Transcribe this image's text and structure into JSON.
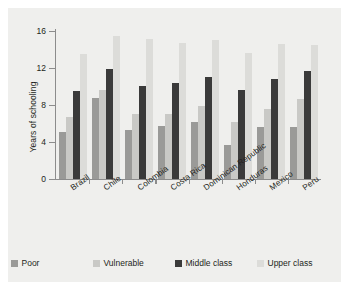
{
  "chart_data": {
    "type": "bar",
    "title": "",
    "subtitle": "",
    "xlabel": "",
    "ylabel": "Years of schooling",
    "ylim": [
      0,
      16
    ],
    "yticks": [
      0,
      4,
      8,
      12,
      16
    ],
    "ytick_labels": [
      "0",
      "4",
      "8",
      "12",
      "16"
    ],
    "grid": false,
    "legend_position": "bottom",
    "categories": [
      "Brazil",
      "Chile",
      "Colombia",
      "Costa Rica",
      "Dominican Republic",
      "Honduras",
      "Mexico",
      "Peru"
    ],
    "series": [
      {
        "name": "Poor",
        "color": "#9a9a98",
        "values": [
          5.1,
          8.8,
          5.3,
          5.7,
          6.2,
          3.7,
          5.6,
          5.6
        ]
      },
      {
        "name": "Vulnerable",
        "color": "#c9c9c6",
        "values": [
          6.7,
          9.6,
          7.0,
          7.0,
          7.9,
          6.2,
          7.6,
          8.7
        ]
      },
      {
        "name": "Middle class",
        "color": "#3a3a3a",
        "values": [
          9.5,
          11.9,
          10.1,
          10.4,
          11.0,
          9.6,
          10.8,
          11.7
        ]
      },
      {
        "name": "Upper class",
        "color": "#dcdcd9",
        "values": [
          13.5,
          15.5,
          15.1,
          14.7,
          15.0,
          13.6,
          14.6,
          14.5
        ]
      }
    ]
  },
  "legend": {
    "items": [
      {
        "label": "Poor",
        "color": "#9a9a98"
      },
      {
        "label": "Vulnerable",
        "color": "#c9c9c6"
      },
      {
        "label": "Middle class",
        "color": "#3a3a3a"
      },
      {
        "label": "Upper class",
        "color": "#dcdcd9"
      }
    ]
  },
  "axis": {
    "y_title": "Years of schooling"
  },
  "colors": {
    "panel_background": "#efefed",
    "figure_background": "#ffffff",
    "axis_line": "#8c8c8c",
    "text": "#231f20"
  }
}
